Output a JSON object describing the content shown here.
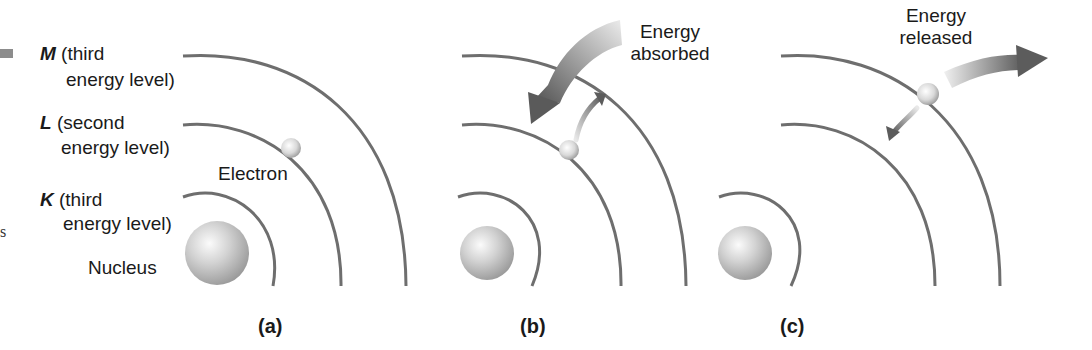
{
  "figure": {
    "panels": [
      {
        "id": "a",
        "caption": "(a)",
        "labels": {
          "M_letter": "M",
          "M_line1": "(third",
          "M_line2": "energy level)",
          "L_letter": "L",
          "L_line1": "(second",
          "L_line2": "energy level)",
          "K_letter": "K",
          "K_line1": "(third",
          "K_line2": "energy level)",
          "electron": "Electron",
          "nucleus": "Nucleus"
        }
      },
      {
        "id": "b",
        "caption": "(b)",
        "energy_line1": "Energy",
        "energy_line2": "absorbed"
      },
      {
        "id": "c",
        "caption": "(c)",
        "energy_line1": "Energy",
        "energy_line2": "released"
      }
    ],
    "edge_fragment": "s",
    "colors": {
      "orbit": "#6e6e6e",
      "nucleus_light": "#f4f4f4",
      "nucleus_dark": "#9a9a9a",
      "arrow_dark": "#5a5a5a",
      "arrow_light": "#e6e6e6",
      "text": "#1a1a1a"
    }
  }
}
